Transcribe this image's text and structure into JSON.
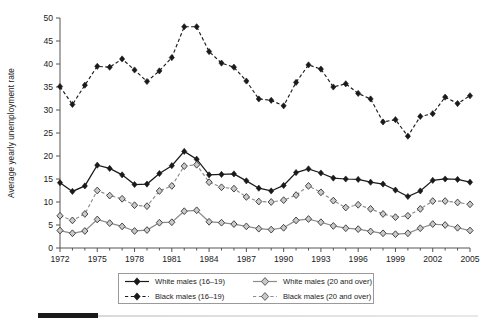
{
  "chart_data": {
    "type": "line",
    "title": "",
    "xlabel": "",
    "ylabel": "Average yearly unemployment rate",
    "xlim": [
      1972,
      2005
    ],
    "ylim": [
      0,
      50
    ],
    "ytick_step": 5,
    "xtick_label_step": 3,
    "grid": false,
    "legend_position": "bottom",
    "yticks": [
      0,
      5,
      10,
      15,
      20,
      25,
      30,
      35,
      40,
      45,
      50
    ],
    "x": [
      1972,
      1973,
      1974,
      1975,
      1976,
      1977,
      1978,
      1979,
      1980,
      1981,
      1982,
      1983,
      1984,
      1985,
      1986,
      1987,
      1988,
      1989,
      1990,
      1991,
      1992,
      1993,
      1994,
      1995,
      1996,
      1997,
      1998,
      1999,
      2000,
      2001,
      2002,
      2003,
      2004,
      2005
    ],
    "xtick_labels": [
      "1972",
      "1975",
      "1978",
      "1981",
      "1984",
      "1987",
      "1990",
      "1993",
      "1996",
      "1999",
      "2002",
      "2005"
    ],
    "series": [
      {
        "name": "White males (16–19)",
        "line": "solid",
        "marker": "filled-diamond",
        "color": "#1a1a1a",
        "values": [
          14.2,
          12.3,
          13.5,
          18.0,
          17.3,
          15.9,
          13.8,
          13.9,
          16.2,
          17.9,
          21.0,
          19.3,
          15.9,
          16.0,
          16.1,
          14.6,
          13.0,
          12.4,
          13.6,
          16.4,
          17.2,
          16.3,
          15.2,
          15.0,
          14.9,
          14.3,
          13.9,
          12.6,
          11.2,
          12.4,
          14.7,
          15.0,
          14.9,
          14.3
        ]
      },
      {
        "name": "Black males (16–19)",
        "line": "dashed",
        "marker": "filled-diamond",
        "color": "#1a1a1a",
        "values": [
          35.1,
          31.2,
          35.4,
          39.5,
          39.3,
          41.1,
          38.7,
          36.2,
          38.5,
          41.4,
          48.1,
          48.1,
          42.7,
          40.2,
          39.3,
          36.3,
          32.4,
          32.1,
          30.9,
          36.0,
          39.8,
          38.9,
          35.0,
          35.7,
          33.6,
          32.4,
          27.4,
          27.9,
          24.3,
          28.6,
          29.2,
          32.8,
          31.4,
          33.1
        ]
      },
      {
        "name": "White males (20 and over)",
        "line": "solid",
        "marker": "gray-diamond",
        "color": "#8c8c8c",
        "values": [
          3.8,
          3.2,
          3.7,
          6.2,
          5.4,
          4.7,
          3.7,
          3.9,
          5.5,
          5.6,
          8.0,
          8.2,
          5.7,
          5.5,
          5.2,
          4.7,
          4.2,
          4.0,
          4.4,
          6.0,
          6.3,
          5.6,
          4.8,
          4.3,
          4.1,
          3.6,
          3.2,
          3.0,
          3.2,
          4.3,
          5.2,
          5.0,
          4.4,
          3.8
        ]
      },
      {
        "name": "Black males (20 and over)",
        "line": "dashed",
        "marker": "gray-diamond",
        "color": "#8c8c8c",
        "values": [
          7.0,
          6.0,
          7.4,
          12.5,
          11.4,
          10.7,
          9.3,
          9.1,
          12.4,
          13.5,
          17.8,
          18.1,
          14.3,
          13.2,
          12.9,
          11.1,
          10.1,
          10.0,
          10.4,
          11.5,
          13.5,
          12.1,
          10.3,
          8.8,
          9.4,
          8.5,
          7.4,
          6.7,
          7.0,
          8.5,
          10.2,
          10.2,
          9.9,
          9.5
        ]
      }
    ]
  },
  "legend": {
    "entries": [
      {
        "label": "White males (16–19)"
      },
      {
        "label": "White males (20 and over)"
      },
      {
        "label": "Black males (16–19)"
      },
      {
        "label": "Black males (20 and over)"
      }
    ]
  }
}
